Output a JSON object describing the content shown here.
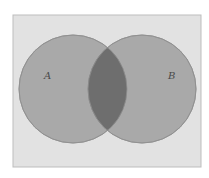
{
  "diagram": {
    "type": "venn",
    "universe": {
      "x": 13,
      "y": 15,
      "width": 188,
      "height": 152,
      "fill": "#e2e2e2",
      "stroke": "#bdbdbd"
    },
    "sets": [
      {
        "label": "A",
        "cx": 73,
        "cy": 89,
        "r": 54,
        "fill": "#a9a9a9",
        "label_x": 44,
        "label_y": 79
      },
      {
        "label": "B",
        "cx": 142,
        "cy": 89,
        "r": 54,
        "fill": "#a9a9a9",
        "label_x": 168,
        "label_y": 79
      }
    ],
    "intersection": {
      "label": "A ∩ B",
      "fill": "#6e6e6e"
    },
    "stroke_color": "#8f8f8f"
  }
}
